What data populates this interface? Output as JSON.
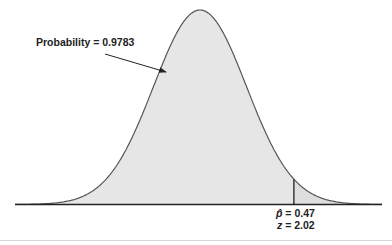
{
  "chart_data": {
    "type": "area",
    "title": "",
    "distribution": "normal",
    "xlabel": "",
    "ylabel": "",
    "grid": false,
    "annotations": [
      {
        "text": "Probability = 0.9783",
        "points_to": "shaded area left of cutoff"
      },
      {
        "text": "p̂ = 0.47",
        "position": "below cutoff line"
      },
      {
        "text": "z = 2.02",
        "position": "below cutoff line"
      }
    ],
    "cutoff": {
      "p_hat": 0.47,
      "z": 2.02
    },
    "shaded_probability": 0.9783,
    "colors": {
      "fill": "#e6e6e6",
      "tail_fill": "#dedede",
      "curve": "#555555",
      "axis": "#222222"
    }
  },
  "labels": {
    "probability": "Probability = 0.9783",
    "phat_symbol": "p̂",
    "phat_value": " = 0.47",
    "z_symbol": "z",
    "z_value": " = 2.02"
  }
}
